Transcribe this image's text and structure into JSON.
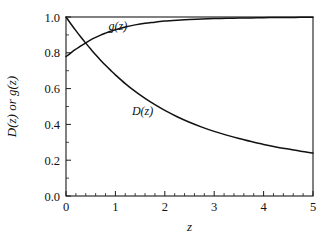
{
  "chart_data": {
    "type": "line",
    "title": "",
    "xlabel": "z",
    "ylabel": "D(z) or g(z)",
    "xlim": [
      0,
      5
    ],
    "ylim": [
      0,
      1
    ],
    "grid": false,
    "legend_position": "inline-annotations",
    "x_ticks": [
      "0",
      "1",
      "2",
      "3",
      "4",
      "5"
    ],
    "x_tick_values": [
      0,
      1,
      2,
      3,
      4,
      5
    ],
    "x_minor_step": 0.2,
    "y_ticks": [
      "0.0",
      "0.2",
      "0.4",
      "0.6",
      "0.8",
      "1.0"
    ],
    "y_tick_values": [
      0.0,
      0.2,
      0.4,
      0.6,
      0.8,
      1.0
    ],
    "y_minor_step": 0.1,
    "annotations": [
      {
        "text": "g(z)",
        "x": 1.05,
        "y": 0.925
      },
      {
        "text": "D(z)",
        "x": 1.55,
        "y": 0.455
      }
    ],
    "x": [
      0,
      0.1,
      0.2,
      0.3,
      0.4,
      0.5,
      0.6,
      0.7,
      0.8,
      0.9,
      1.0,
      1.2,
      1.4,
      1.6,
      1.8,
      2.0,
      2.25,
      2.5,
      2.75,
      3.0,
      3.25,
      3.5,
      3.75,
      4.0,
      4.25,
      4.5,
      4.75,
      5.0
    ],
    "series": [
      {
        "name": "D(z)",
        "color": "#111111",
        "values": [
          1.0,
          0.961,
          0.924,
          0.888,
          0.854,
          0.821,
          0.789,
          0.759,
          0.73,
          0.703,
          0.677,
          0.628,
          0.584,
          0.545,
          0.51,
          0.478,
          0.443,
          0.412,
          0.385,
          0.361,
          0.34,
          0.321,
          0.304,
          0.288,
          0.274,
          0.262,
          0.25,
          0.24
        ]
      },
      {
        "name": "g(z)",
        "color": "#111111",
        "values": [
          0.779,
          0.8,
          0.82,
          0.839,
          0.856,
          0.872,
          0.886,
          0.899,
          0.91,
          0.92,
          0.929,
          0.944,
          0.956,
          0.965,
          0.971,
          0.977,
          0.982,
          0.986,
          0.989,
          0.991,
          0.993,
          0.994,
          0.995,
          0.996,
          0.997,
          0.997,
          0.998,
          0.998
        ]
      }
    ]
  },
  "plot_geometry": {
    "left": 66,
    "right": 313,
    "top": 17,
    "bottom": 196
  }
}
